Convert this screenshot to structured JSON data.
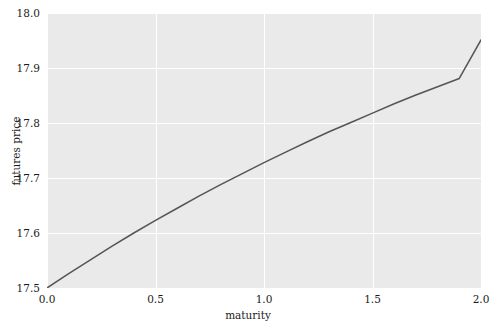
{
  "chart_data": {
    "type": "line",
    "title": "",
    "xlabel": "maturity",
    "ylabel": "futures price",
    "xlim": [
      0.0,
      2.0
    ],
    "ylim": [
      17.5,
      18.0
    ],
    "xticks": [
      "0.0",
      "0.5",
      "1.0",
      "1.5",
      "2.0"
    ],
    "xtick_values": [
      0.0,
      0.5,
      1.0,
      1.5,
      2.0
    ],
    "yticks": [
      "17.5",
      "17.6",
      "17.7",
      "17.8",
      "17.9",
      "18.0"
    ],
    "ytick_values": [
      17.5,
      17.6,
      17.7,
      17.8,
      17.9,
      18.0
    ],
    "grid": true,
    "grid_color": "#ffffff",
    "plot_background": "#eaeaea",
    "figure_background": "#ffffff",
    "legend": null,
    "legend_position": "none",
    "series": [
      {
        "name": "futures price curve",
        "color": "#555555",
        "linewidth": 1.5,
        "x": [
          0.0,
          0.1,
          0.2,
          0.3,
          0.4,
          0.5,
          0.6,
          0.7,
          0.8,
          0.9,
          1.0,
          1.1,
          1.2,
          1.3,
          1.4,
          1.5,
          1.6,
          1.7,
          1.8,
          1.9,
          2.0
        ],
        "values": [
          17.5,
          17.526,
          17.551,
          17.576,
          17.6,
          17.623,
          17.645,
          17.667,
          17.688,
          17.708,
          17.728,
          17.747,
          17.766,
          17.784,
          17.801,
          17.818,
          17.835,
          17.851,
          17.866,
          17.881,
          17.951
        ]
      }
    ]
  }
}
